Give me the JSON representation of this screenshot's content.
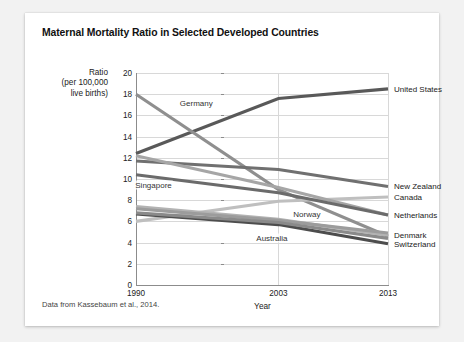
{
  "card": {
    "title": "Maternal Mortality Ratio in Selected Developed Countries",
    "source_note": "Data from Kassebaum et al., 2014."
  },
  "chart_data": {
    "type": "line",
    "title": "Maternal Mortality Ratio in Selected Developed Countries",
    "xlabel": "Year",
    "ylabel": "Ratio\n(per 100,000\nlive births)",
    "ylabel_lines": [
      "Ratio",
      "(per 100,000",
      "live births)"
    ],
    "categories": [
      "1990",
      "2003",
      "2013"
    ],
    "x": [
      1990,
      2003,
      2013
    ],
    "ylim": [
      0,
      20
    ],
    "ytick_values": [
      0,
      2,
      4,
      6,
      8,
      10,
      12,
      14,
      16,
      18,
      20
    ],
    "ytick_labels": [
      "0",
      "2",
      "4",
      "6",
      "8",
      "10",
      "12",
      "14",
      "16",
      "18",
      "20"
    ],
    "xtick_labels": [
      "1990",
      "2003",
      "2013"
    ],
    "grid": true,
    "legend_position": "inline-and-right",
    "source": "Data from Kassebaum et al., 2014.",
    "series": [
      {
        "name": "United States",
        "values": [
          12.4,
          17.6,
          18.5
        ],
        "color": "#595959",
        "width": 3.1,
        "label_side": "right",
        "label_y": 18.5
      },
      {
        "name": "Germany",
        "values": [
          18.0,
          9.0,
          4.6
        ],
        "color": "#8f8f8f",
        "width": 3.1,
        "label_side": "inline",
        "label_x": 1995.5,
        "label_y": 17.2
      },
      {
        "name": "New Zealand",
        "values": [
          11.7,
          10.9,
          9.3
        ],
        "color": "#707070",
        "width": 3.1,
        "label_side": "right",
        "label_y": 9.3
      },
      {
        "name": "Canada",
        "values": [
          6.0,
          7.9,
          8.3
        ],
        "color": "#bfbfbf",
        "width": 3.1,
        "label_side": "right",
        "label_y": 8.3
      },
      {
        "name": "Netherlands",
        "values": [
          12.2,
          9.2,
          6.6
        ],
        "color": "#a6a6a6",
        "width": 3.1,
        "label_side": "right",
        "label_y": 6.6
      },
      {
        "name": "Denmark",
        "values": [
          7.4,
          6.2,
          4.7
        ],
        "color": "#b3b3b3",
        "width": 3.1,
        "label_side": "right",
        "label_y": 4.7
      },
      {
        "name": "Switzerland",
        "values": [
          6.7,
          5.7,
          3.9
        ],
        "color": "#4d4d4d",
        "width": 3.1,
        "label_side": "right",
        "label_y": 3.9
      },
      {
        "name": "Singapore",
        "values": [
          10.4,
          8.7,
          6.6
        ],
        "color": "#6b6b6b",
        "width": 3.1,
        "label_side": "inline",
        "label_x": 1991.6,
        "label_y": 9.4
      },
      {
        "name": "Norway",
        "values": [
          7.2,
          6.1,
          4.9
        ],
        "color": "#9c9c9c",
        "width": 3.1,
        "label_side": "inline",
        "label_x": 2005.6,
        "label_y": 6.7
      },
      {
        "name": "Australia",
        "values": [
          6.8,
          5.9,
          4.4
        ],
        "color": "#8a8a8a",
        "width": 3.1,
        "label_side": "inline",
        "label_x": 2002.4,
        "label_y": 4.4
      }
    ]
  }
}
